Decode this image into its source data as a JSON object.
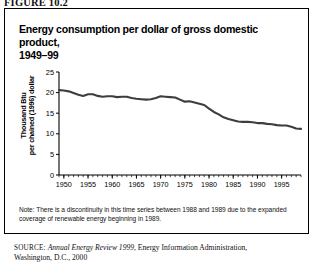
{
  "figure": {
    "label": "FIGURE 10.2"
  },
  "title": {
    "line1": "Energy consumption per dollar of gross domestic product,",
    "line2": "1949–99"
  },
  "note": {
    "text": "Note: There is a discontinuity in this time series between 1988 and 1989 due to the expanded coverage of renewable energy beginning in 1989."
  },
  "source": {
    "prefix": "SOURCE:",
    "italic_part": "Annual Energy Review 1999",
    "rest": ", Energy Information Administration, Washington, D.C., 2000"
  },
  "axis": {
    "y_ticks": [
      "0",
      "5",
      "10",
      "15",
      "20",
      "25"
    ],
    "x_ticks": [
      "1950",
      "1955",
      "1960",
      "1965",
      "1970",
      "1975",
      "1980",
      "1985",
      "1990",
      "1995"
    ],
    "y_label_line1": "Thousand Btu",
    "y_label_line2": "per chained (1996) dollar"
  },
  "colors": {
    "line": "#3d3d3d",
    "axis": "#000000",
    "border": "#000000",
    "background": "#ffffff"
  },
  "chart_data": {
    "type": "line",
    "title": "Energy consumption per dollar of gross domestic product, 1949–99",
    "xlabel": "",
    "ylabel": "Thousand Btu per chained (1996) dollar",
    "xlim": [
      1949,
      1999
    ],
    "ylim": [
      0,
      25
    ],
    "grid": false,
    "legend": "none",
    "x": [
      1949,
      1950,
      1951,
      1952,
      1953,
      1954,
      1955,
      1956,
      1957,
      1958,
      1959,
      1960,
      1961,
      1962,
      1963,
      1964,
      1965,
      1966,
      1967,
      1968,
      1969,
      1970,
      1971,
      1972,
      1973,
      1974,
      1975,
      1976,
      1977,
      1978,
      1979,
      1980,
      1981,
      1982,
      1983,
      1984,
      1985,
      1986,
      1987,
      1988,
      1989,
      1990,
      1991,
      1992,
      1993,
      1994,
      1995,
      1996,
      1997,
      1998,
      1999
    ],
    "series": [
      {
        "name": "Energy consumption per dollar of GDP",
        "values": [
          20.6,
          20.5,
          20.3,
          19.9,
          19.5,
          19.2,
          19.6,
          19.6,
          19.2,
          19.0,
          19.1,
          19.1,
          18.9,
          19.0,
          19.0,
          18.7,
          18.5,
          18.4,
          18.3,
          18.4,
          18.7,
          19.1,
          19.0,
          18.9,
          18.8,
          18.3,
          17.8,
          17.9,
          17.6,
          17.3,
          17.0,
          16.1,
          15.3,
          14.7,
          14.0,
          13.6,
          13.3,
          13.0,
          12.9,
          12.9,
          12.8,
          12.6,
          12.6,
          12.4,
          12.3,
          12.1,
          12.0,
          12.0,
          11.7,
          11.3,
          11.2
        ]
      }
    ]
  }
}
